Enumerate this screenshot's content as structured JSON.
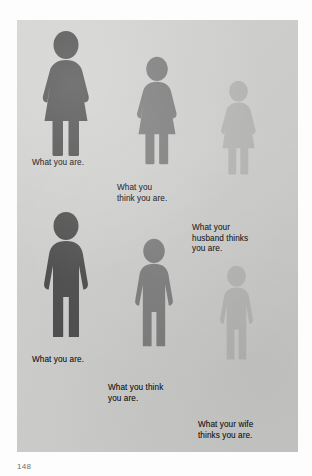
{
  "page": {
    "type": "scanned-book-illustration",
    "folio": "148",
    "plate_background_color": "#cdcdcb",
    "caption_color": "#1b1b1b"
  },
  "illustration": {
    "title_text_present": false,
    "theme": "body-image perception pictograms",
    "rows": [
      {
        "id": "women-row",
        "gender": "female",
        "figures": [
          {
            "id": "woman-actual",
            "icon": "female-pictogram-icon",
            "size_rank": "largest",
            "color": "#4e4e4e",
            "caption": "What you are."
          },
          {
            "id": "woman-self-image",
            "icon": "female-pictogram-icon",
            "size_rank": "medium",
            "color": "#7b7b7b",
            "caption": "What you\nthink you are."
          },
          {
            "id": "woman-husband-image",
            "icon": "female-pictogram-icon",
            "size_rank": "smallest",
            "color": "#b4b4b2",
            "caption": "What your\nhusband thinks\nyou are."
          }
        ]
      },
      {
        "id": "men-row",
        "gender": "male",
        "figures": [
          {
            "id": "man-actual",
            "icon": "male-pictogram-icon",
            "size_rank": "largest",
            "color": "#4e4e4e",
            "caption": "What you are."
          },
          {
            "id": "man-self-image",
            "icon": "male-pictogram-icon",
            "size_rank": "medium",
            "color": "#7b7b7b",
            "caption": "What you think\nyou are."
          },
          {
            "id": "man-wife-image",
            "icon": "male-pictogram-icon",
            "size_rank": "smallest",
            "color": "#b4b4b2",
            "caption": "What your wife\nthinks you are."
          }
        ]
      }
    ]
  }
}
